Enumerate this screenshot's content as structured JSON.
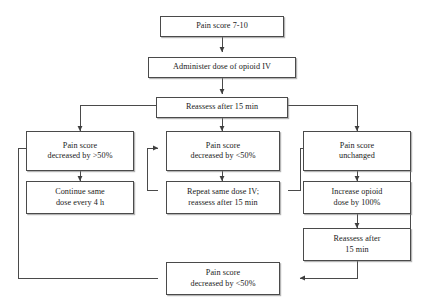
{
  "diagram": {
    "type": "flowchart",
    "stroke_color": "#4a4a4a",
    "text_color": "#1a1a1a",
    "background_color": "#ffffff"
  },
  "nodes": {
    "start": {
      "id": "start",
      "lines": [
        "Pain score 7-10"
      ]
    },
    "administer": {
      "id": "administer",
      "lines": [
        "Administer dose of opioid IV"
      ]
    },
    "reassess_top": {
      "id": "reassess_top",
      "lines": [
        "Reassess after 15 min"
      ]
    },
    "decreased_gt50": {
      "id": "decreased_gt50",
      "lines": [
        "Pain score",
        "decreased by >50%"
      ]
    },
    "decreased_lt50": {
      "id": "decreased_lt50",
      "lines": [
        "Pain score",
        "decreased by <50%"
      ]
    },
    "unchanged": {
      "id": "unchanged",
      "lines": [
        "Pain score",
        "unchanged"
      ]
    },
    "continue_same": {
      "id": "continue_same",
      "lines": [
        "Continue same",
        "dose every 4 h"
      ]
    },
    "repeat_same": {
      "id": "repeat_same",
      "lines": [
        "Repeat same dose IV;",
        "reassess after 15 min"
      ]
    },
    "increase_opioid": {
      "id": "increase_opioid",
      "lines": [
        "Increase opioid",
        "dose by 100%"
      ]
    },
    "reassess_right": {
      "id": "reassess_right",
      "lines": [
        "Reassess after",
        "15 min"
      ]
    },
    "bottom_lt50": {
      "id": "bottom_lt50",
      "lines": [
        "Pain score",
        "decreased by <50%"
      ]
    }
  },
  "edges": [
    {
      "from": "start",
      "to": "administer",
      "label": ""
    },
    {
      "from": "administer",
      "to": "reassess_top",
      "label": ""
    },
    {
      "from": "reassess_top",
      "to": "decreased_gt50",
      "label": ""
    },
    {
      "from": "reassess_top",
      "to": "decreased_lt50",
      "label": ""
    },
    {
      "from": "reassess_top",
      "to": "unchanged",
      "label": ""
    },
    {
      "from": "decreased_gt50",
      "to": "continue_same",
      "label": ""
    },
    {
      "from": "decreased_lt50",
      "to": "repeat_same",
      "label": ""
    },
    {
      "from": "unchanged",
      "to": "increase_opioid",
      "label": ""
    },
    {
      "from": "increase_opioid",
      "to": "reassess_right",
      "label": ""
    },
    {
      "from": "reassess_right",
      "to": "bottom_lt50",
      "label": ""
    },
    {
      "from": "reassess_right",
      "to": "unchanged",
      "label": ""
    },
    {
      "from": "repeat_same",
      "to": "decreased_lt50",
      "label": ""
    },
    {
      "from": "repeat_same",
      "to": "unchanged",
      "label": ""
    },
    {
      "from": "bottom_lt50",
      "to": "decreased_gt50",
      "label": ""
    }
  ]
}
